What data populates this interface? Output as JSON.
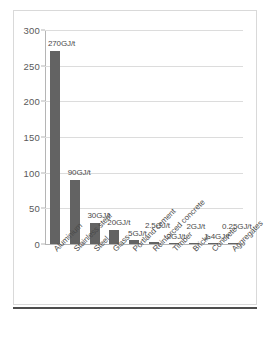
{
  "chart_data": {
    "type": "bar",
    "title": "",
    "subtitle": "",
    "xlabel": "",
    "ylabel": "",
    "ylim": [
      0,
      300
    ],
    "yticks": [
      0,
      50,
      100,
      150,
      200,
      250,
      300
    ],
    "ytick_labels": [
      "0",
      "50",
      "100",
      "150",
      "200",
      "250",
      "300"
    ],
    "grid": true,
    "legend": false,
    "bar_color": "#636363",
    "gridline_color": "#dcdcdc",
    "axis_color": "#b5b5b5",
    "categories": [
      "Aluminium",
      "Stainless steel",
      "Steel",
      "Glass",
      "Portland cement",
      "Reinforced concrete",
      "Timber",
      "Bricks",
      "Concrete",
      "Aggregates"
    ],
    "values": [
      270,
      90,
      30,
      20,
      5,
      2.5,
      2,
      2,
      1.4,
      0.25
    ],
    "data_labels": [
      "270GJ/t",
      "90GJ/t",
      "30GJ/t",
      "20GJ/t",
      "5GJ/t",
      "2.5GJ/t",
      "2GJ/t",
      "2GJ/t",
      "1.4GJ/t",
      "0.25GJ/t"
    ]
  }
}
